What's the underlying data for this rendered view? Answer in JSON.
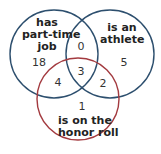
{
  "diagram": {
    "type": "venn",
    "sets": [
      {
        "label_lines": [
          "has",
          "part-time",
          "job"
        ],
        "color": "#2d4f6e"
      },
      {
        "label_lines": [
          "is an",
          "athlete"
        ],
        "color": "#2d4f6e"
      },
      {
        "label_lines": [
          "is on the",
          "honor roll"
        ],
        "color": "#a33a3f"
      }
    ],
    "regions": {
      "job_only": "18",
      "athlete_only": "5",
      "honor_only": "1",
      "job_athlete": "0",
      "job_honor": "4",
      "athlete_honor": "2",
      "all_three": "3"
    }
  }
}
